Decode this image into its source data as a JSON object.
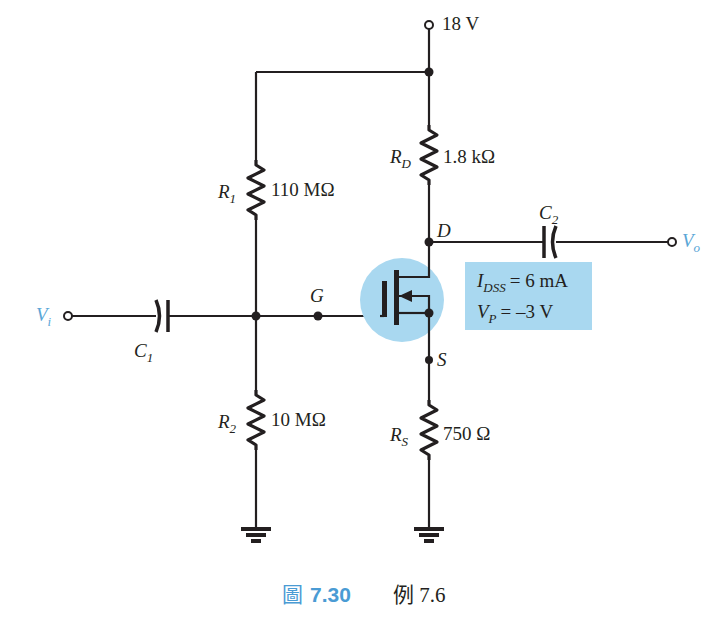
{
  "diagram": {
    "type": "JFET voltage-divider bias circuit",
    "supply": {
      "label": "18 V"
    },
    "resistors": {
      "R1": {
        "name": "R",
        "sub": "1",
        "value": "110 MΩ"
      },
      "R2": {
        "name": "R",
        "sub": "2",
        "value": "10 MΩ"
      },
      "RD": {
        "name": "R",
        "sub": "D",
        "value": "1.8 kΩ"
      },
      "RS": {
        "name": "R",
        "sub": "S",
        "value": "750 Ω"
      }
    },
    "capacitors": {
      "C1": {
        "name": "C",
        "sub": "1"
      },
      "C2": {
        "name": "C",
        "sub": "2"
      }
    },
    "terminals": {
      "input": {
        "name": "V",
        "sub": "i"
      },
      "output": {
        "name": "V",
        "sub": "o"
      }
    },
    "nodes": {
      "gate": "G",
      "drain": "D",
      "source": "S"
    },
    "parameters": {
      "idss": {
        "name": "I",
        "sub": "DSS",
        "value": "= 6 mA"
      },
      "vp": {
        "name": "V",
        "sub": "P",
        "value": "= –3 V"
      }
    },
    "colors": {
      "highlight": "#a9d8f0",
      "param_box": "#a9d8f0",
      "accent": "#4a9bd4",
      "ink": "#231f20"
    }
  },
  "caption": {
    "figure_label": "7.30",
    "figure_prefix_glyph": "圖",
    "text": "例 7.6"
  }
}
